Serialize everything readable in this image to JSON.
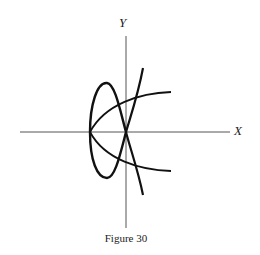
{
  "figure": {
    "caption": "Figure 30",
    "x_axis_label": "X",
    "y_axis_label": "Y"
  },
  "geometry": {
    "origin": [
      126,
      132
    ],
    "x_axis": {
      "from": [
        20,
        132
      ],
      "to": [
        230,
        132
      ]
    },
    "y_axis": {
      "from": [
        126,
        36
      ],
      "to": [
        126,
        228
      ]
    }
  },
  "curves": [
    {
      "name": "closed-loop-curve",
      "description": "closed loop through origin, extending left to x-axis at vertex"
    },
    {
      "name": "parabola-curve",
      "description": "sideways parabola opening right with vertex on negative x-axis"
    },
    {
      "name": "cusp-curve",
      "description": "steep curve passing through origin"
    }
  ],
  "colors": {
    "stroke": "#111111",
    "axis": "#555555",
    "background": "#ffffff"
  }
}
